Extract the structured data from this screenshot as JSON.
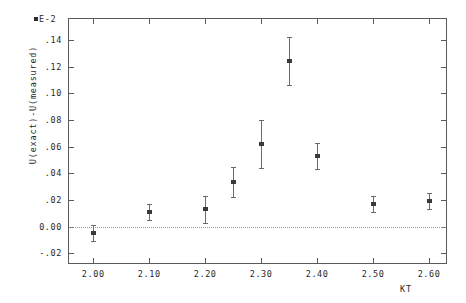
{
  "chart_data": {
    "type": "scatter",
    "title": "",
    "xlabel": "KT",
    "ylabel": "U(exact)-U(measured)",
    "y_exponent": "E-2",
    "xlim": [
      1.955,
      2.632
    ],
    "ylim": [
      -0.028,
      0.1565
    ],
    "grid": false,
    "legend": null,
    "zero_reference_line": 0.0,
    "x_ticks": [
      "2.00",
      "2.10",
      "2.20",
      "2.30",
      "2.40",
      "2.50",
      "2.60"
    ],
    "x_tick_values": [
      2.0,
      2.1,
      2.2,
      2.3,
      2.4,
      2.5,
      2.6
    ],
    "y_ticks": [
      ".14",
      ".12",
      ".10",
      ".08",
      ".06",
      ".04",
      ".02",
      "0.00",
      "-.02"
    ],
    "y_tick_values": [
      0.14,
      0.12,
      0.1,
      0.08,
      0.06,
      0.04,
      0.02,
      0.0,
      -0.02
    ],
    "x": [
      2.0,
      2.1,
      2.2,
      2.25,
      2.3,
      2.35,
      2.4,
      2.5,
      2.6
    ],
    "values": [
      -0.005,
      0.011,
      0.013,
      0.0335,
      0.062,
      0.124,
      0.053,
      0.017,
      0.019
    ],
    "yerr": [
      0.006,
      0.006,
      0.01,
      0.011,
      0.018,
      0.018,
      0.01,
      0.006,
      0.006
    ],
    "series": [
      {
        "name": "U(exact)-U(measured)",
        "points": [
          {
            "x": 2.0,
            "y": -0.005,
            "err": 0.006
          },
          {
            "x": 2.1,
            "y": 0.011,
            "err": 0.006
          },
          {
            "x": 2.2,
            "y": 0.013,
            "err": 0.01
          },
          {
            "x": 2.25,
            "y": 0.0335,
            "err": 0.011
          },
          {
            "x": 2.3,
            "y": 0.062,
            "err": 0.018
          },
          {
            "x": 2.35,
            "y": 0.124,
            "err": 0.018
          },
          {
            "x": 2.4,
            "y": 0.053,
            "err": 0.01
          },
          {
            "x": 2.5,
            "y": 0.017,
            "err": 0.006
          },
          {
            "x": 2.6,
            "y": 0.019,
            "err": 0.006
          }
        ]
      }
    ],
    "colors": {
      "axis": "#5a5a5a",
      "marker": "#3a3a3a",
      "errorbar": "#6b6b6b",
      "zeroline": "#9a9a9a",
      "background": "#ffffff"
    }
  }
}
